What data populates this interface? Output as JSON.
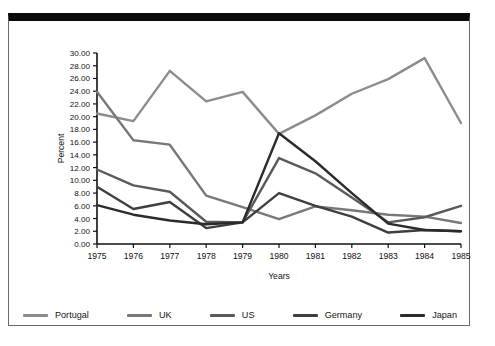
{
  "chart_data": {
    "type": "line",
    "title": "",
    "xlabel": "Years",
    "ylabel": "Percent",
    "categories": [
      "1975",
      "1976",
      "1977",
      "1978",
      "1979",
      "1980",
      "1981",
      "1982",
      "1983",
      "1984",
      "1985"
    ],
    "x": [
      1975,
      1976,
      1977,
      1978,
      1979,
      1980,
      1981,
      1982,
      1983,
      1984,
      1985
    ],
    "ylim": [
      0.0,
      30.0
    ],
    "yticks": [
      "0.00",
      "2.00",
      "4.00",
      "6.00",
      "8.00",
      "10.00",
      "12.00",
      "14.00",
      "16.00",
      "18.00",
      "20.00",
      "22.00",
      "24.00",
      "26.00",
      "28.00",
      "30.00"
    ],
    "ytick_values": [
      0,
      2,
      4,
      6,
      8,
      10,
      12,
      14,
      16,
      18,
      20,
      22,
      24,
      26,
      28,
      30
    ],
    "grid": false,
    "legend_position": "bottom",
    "series": [
      {
        "name": "Portugal",
        "color": "#8c8c8c",
        "values": [
          20.5,
          19.3,
          27.2,
          22.4,
          23.9,
          17.3,
          20.2,
          23.6,
          25.9,
          29.2,
          19.0
        ]
      },
      {
        "name": "UK",
        "color": "#787878",
        "values": [
          23.9,
          16.3,
          15.6,
          7.6,
          5.8,
          3.9,
          5.9,
          5.3,
          4.6,
          4.3,
          3.3
        ]
      },
      {
        "name": "US",
        "color": "#5a5a5a",
        "values": [
          11.7,
          9.2,
          8.2,
          3.5,
          3.4,
          13.5,
          11.1,
          7.3,
          3.4,
          4.2,
          6.0
        ]
      },
      {
        "name": "Germany",
        "color": "#3f3f3f",
        "values": [
          9.0,
          5.5,
          6.6,
          2.5,
          3.4,
          8.0,
          6.0,
          4.3,
          1.8,
          2.2,
          2.0
        ]
      },
      {
        "name": "Japan",
        "color": "#2b2b2b",
        "values": [
          6.1,
          4.6,
          3.7,
          3.1,
          3.4,
          17.4,
          13.0,
          8.0,
          3.2,
          2.2,
          2.0
        ]
      }
    ]
  },
  "legend": {
    "items": [
      {
        "label": "Portugal",
        "color": "#8c8c8c"
      },
      {
        "label": "UK",
        "color": "#787878"
      },
      {
        "label": "US",
        "color": "#5a5a5a"
      },
      {
        "label": "Germany",
        "color": "#3f3f3f"
      },
      {
        "label": "Japan",
        "color": "#2b2b2b"
      }
    ]
  }
}
